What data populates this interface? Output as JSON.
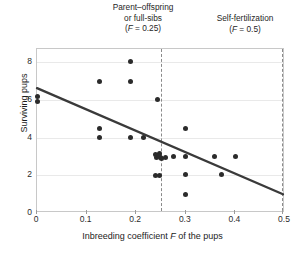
{
  "chart_data": {
    "type": "scatter",
    "title": "",
    "xlabel": "Inbreeding coefficient F of the pups",
    "ylabel": "Surviving pups",
    "xlim": [
      0,
      0.5
    ],
    "ylim": [
      0,
      8.7
    ],
    "grid": true,
    "legend": "none",
    "xticks": [
      0,
      0.1,
      0.2,
      0.3,
      0.4,
      0.5
    ],
    "xtick_labels": [
      "0",
      "0.1",
      "0.2",
      "0.3",
      "0.4",
      "0.5"
    ],
    "yticks": [
      0,
      2,
      4,
      6,
      8
    ],
    "ytick_labels": [
      "0",
      "2",
      "4",
      "6",
      "8"
    ],
    "points": [
      {
        "x": 0.0,
        "y": 6.2
      },
      {
        "x": 0.0,
        "y": 5.9
      },
      {
        "x": 0.125,
        "y": 7.0
      },
      {
        "x": 0.125,
        "y": 4.5
      },
      {
        "x": 0.125,
        "y": 4.0
      },
      {
        "x": 0.188,
        "y": 8.05
      },
      {
        "x": 0.188,
        "y": 7.0
      },
      {
        "x": 0.188,
        "y": 4.0
      },
      {
        "x": 0.215,
        "y": 4.0
      },
      {
        "x": 0.243,
        "y": 6.0
      },
      {
        "x": 0.238,
        "y": 3.1
      },
      {
        "x": 0.246,
        "y": 3.15
      },
      {
        "x": 0.241,
        "y": 2.92
      },
      {
        "x": 0.249,
        "y": 2.95
      },
      {
        "x": 0.245,
        "y": 3.03
      },
      {
        "x": 0.252,
        "y": 2.9
      },
      {
        "x": 0.26,
        "y": 2.92
      },
      {
        "x": 0.238,
        "y": 2.0
      },
      {
        "x": 0.247,
        "y": 2.0
      },
      {
        "x": 0.275,
        "y": 3.0
      },
      {
        "x": 0.3,
        "y": 4.5
      },
      {
        "x": 0.3,
        "y": 3.0
      },
      {
        "x": 0.3,
        "y": 2.05
      },
      {
        "x": 0.3,
        "y": 1.0
      },
      {
        "x": 0.358,
        "y": 3.0
      },
      {
        "x": 0.372,
        "y": 2.05
      },
      {
        "x": 0.4,
        "y": 3.0
      }
    ],
    "trendline": {
      "x0": 0.0,
      "y0": 6.6,
      "x1": 0.5,
      "y1": 0.9
    },
    "reference_lines": [
      {
        "x": 0.25,
        "style": "dashed"
      },
      {
        "x": 0.5,
        "style": "dashed"
      }
    ],
    "annotations": [
      {
        "id": "parent-offspring",
        "line1": "Parent–offspring",
        "line2": "or full-sibs",
        "line3_prefix": "(",
        "line3_italic": "F",
        "line3_suffix": " = 0.25)"
      },
      {
        "id": "self-fertilization",
        "line1": "Self-fertilization",
        "line2": "",
        "line3_prefix": "(",
        "line3_italic": "F",
        "line3_suffix": " = 0.5)"
      }
    ]
  },
  "axis": {
    "x_title_prefix": "Inbreeding coefficient ",
    "x_title_italic": "F",
    "x_title_suffix": " of the pups",
    "y_title": "Surviving pups"
  },
  "colors": {
    "point": "#2b2b2b",
    "trendline": "#3a3a3a",
    "reference_line": "#8a8a8a",
    "gridline": "#e9e9e9",
    "frame": "#c8c8c8",
    "text": "#1c1c1c",
    "background": "#ffffff"
  }
}
